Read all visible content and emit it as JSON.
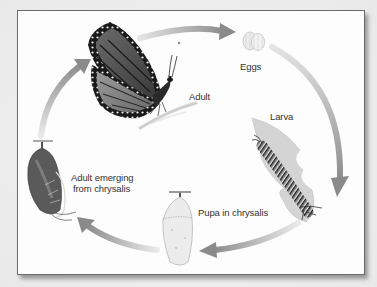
{
  "diagram": {
    "type": "cycle",
    "stages": [
      {
        "id": "eggs",
        "label": "Eggs"
      },
      {
        "id": "larva",
        "label": "Larva"
      },
      {
        "id": "pupa",
        "label": "Pupa in chrysalis"
      },
      {
        "id": "emerging",
        "label_line1": "Adult emerging",
        "label_line2": "from chrysalis"
      },
      {
        "id": "adult",
        "label": "Adult"
      }
    ],
    "arrows": [
      {
        "from": "adult",
        "to": "eggs"
      },
      {
        "from": "eggs",
        "to": "larva"
      },
      {
        "from": "larva",
        "to": "pupa"
      },
      {
        "from": "pupa",
        "to": "emerging"
      },
      {
        "from": "emerging",
        "to": "adult"
      }
    ],
    "colors": {
      "arrow": "#9a9a9a",
      "frame_border": "#6a6a6a",
      "background": "#fdfdfd",
      "label_text": "#333333"
    }
  }
}
